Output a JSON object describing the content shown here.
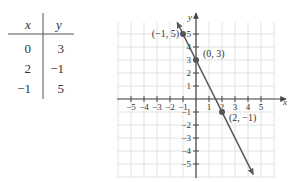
{
  "table": {
    "headers": [
      "x",
      "y"
    ],
    "rows": [
      [
        "0",
        "3"
      ],
      [
        "2",
        "−1"
      ],
      [
        "−1",
        "5"
      ]
    ]
  },
  "chart_data": {
    "type": "line",
    "title": "",
    "xlabel": "x",
    "ylabel": "y",
    "xlim": [
      -6,
      6
    ],
    "ylim": [
      -6,
      6
    ],
    "grid": true,
    "x_ticks": [
      -5,
      -4,
      -3,
      -2,
      -1,
      1,
      2,
      3,
      4,
      5
    ],
    "y_ticks": [
      -5,
      -4,
      -3,
      -2,
      -1,
      1,
      2,
      3,
      4,
      5
    ],
    "x_tick_labels": [
      "−5",
      "−4",
      "−3",
      "−2",
      "−1",
      "1",
      "2",
      "3",
      "4",
      "5"
    ],
    "y_tick_labels": [
      "−5",
      "−4",
      "−3",
      "−2",
      "−1",
      "1",
      "2",
      "3",
      "4",
      "5"
    ],
    "line": {
      "equation": "y = -2x + 3",
      "slope": -2,
      "intercept": 3,
      "x_range": [
        -1.45,
        4.4
      ]
    },
    "points": [
      {
        "x": -1,
        "y": 5,
        "label": "(−1, 5)",
        "label_pos": "left"
      },
      {
        "x": 0,
        "y": 3,
        "label": "(0, 3)",
        "label_pos": "right"
      },
      {
        "x": 2,
        "y": -1,
        "label": "(2, −1)",
        "label_pos": "right"
      }
    ],
    "colors": {
      "line": "#5a5a5a",
      "grid": "#e2e2e2",
      "axis": "#444444",
      "point": "#555555"
    }
  }
}
